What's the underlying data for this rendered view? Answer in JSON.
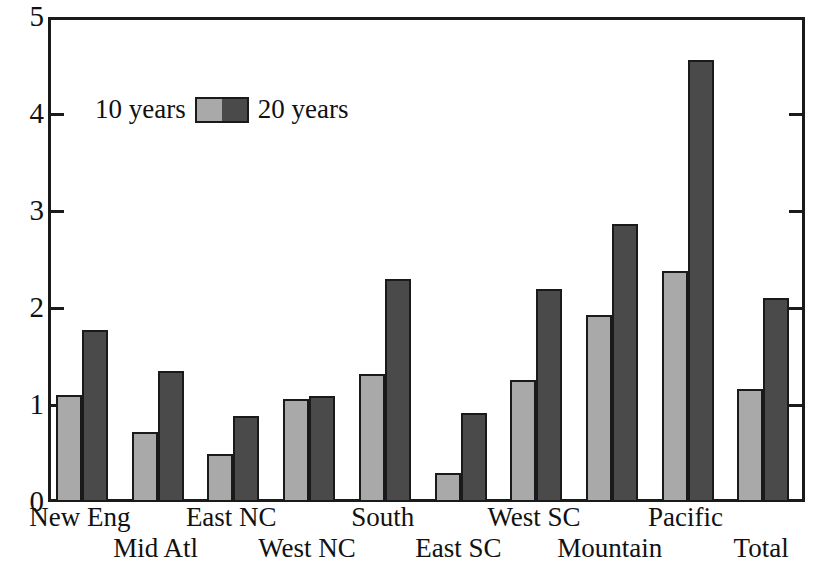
{
  "chart_data": {
    "type": "bar",
    "title": "",
    "subtitle": "",
    "xlabel": "",
    "ylabel": "",
    "ylim": [
      0,
      5
    ],
    "y_ticks": [
      0,
      1,
      2,
      3,
      4,
      5
    ],
    "y_tick_labels": [
      "0",
      "1",
      "2",
      "3",
      "4",
      "5"
    ],
    "grid": false,
    "legend_position": "upper-left-inside",
    "categories": [
      "New Eng",
      "Mid Atl",
      "East NC",
      "West NC",
      "South",
      "East SC",
      "West SC",
      "Mountain",
      "Pacific",
      "Total"
    ],
    "series": [
      {
        "name": "10 years",
        "color": "#a9a9a9",
        "values": [
          1.1,
          0.72,
          0.5,
          1.06,
          1.32,
          0.3,
          1.26,
          1.93,
          2.38,
          1.17
        ]
      },
      {
        "name": "20 years",
        "color": "#4a4a4a",
        "values": [
          1.77,
          1.35,
          0.89,
          1.09,
          2.3,
          0.92,
          2.2,
          2.87,
          4.56,
          2.1
        ]
      }
    ]
  },
  "legend": {
    "left_label": "10 years",
    "right_label": "20 years"
  },
  "axis_colors": {
    "frame": "#1a1a1a",
    "text": "#111111",
    "background": "#ffffff"
  }
}
